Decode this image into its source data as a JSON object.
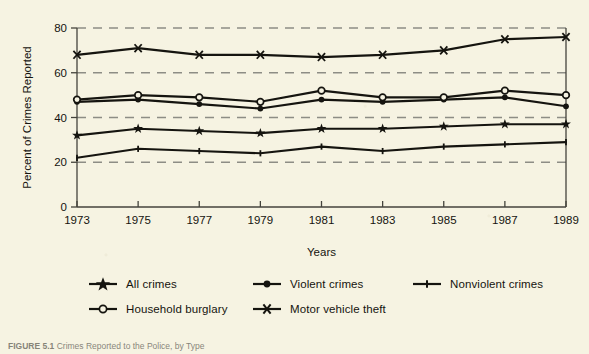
{
  "figure": {
    "caption_label": "FIGURE 5.1",
    "caption_body": "Crimes Reported to the Police, by Type"
  },
  "chart_data": {
    "type": "line",
    "title": "",
    "xlabel": "Years",
    "ylabel": "Percent of Crimes Reported",
    "x": [
      1973,
      1975,
      1977,
      1979,
      1981,
      1983,
      1985,
      1987,
      1989
    ],
    "xtick_labels": [
      "1973",
      "1975",
      "1977",
      "1979",
      "1981",
      "1983",
      "1985",
      "1987",
      "1989"
    ],
    "ytick_labels": [
      "0",
      "20",
      "40",
      "60",
      "80"
    ],
    "yticks": [
      0,
      20,
      40,
      60,
      80
    ],
    "ylim": [
      0,
      80
    ],
    "xlim": [
      1973,
      1989
    ],
    "grid": "horizontal-dashed",
    "legend_position": "below-plot",
    "series": [
      {
        "name": "All crimes",
        "marker": "star",
        "values": [
          32,
          35,
          34,
          33,
          35,
          35,
          36,
          37,
          37
        ]
      },
      {
        "name": "Violent crimes",
        "marker": "filled-circle",
        "values": [
          47,
          48,
          46,
          44,
          48,
          47,
          48,
          49,
          45
        ]
      },
      {
        "name": "Nonviolent crimes",
        "marker": "small-plus",
        "values": [
          22,
          26,
          25,
          24,
          27,
          25,
          27,
          28,
          29
        ]
      },
      {
        "name": "Household burglary",
        "marker": "open-circle",
        "values": [
          48,
          50,
          49,
          47,
          52,
          49,
          49,
          52,
          50
        ]
      },
      {
        "name": "Motor vehicle theft",
        "marker": "x-cross",
        "values": [
          68,
          71,
          68,
          68,
          67,
          68,
          70,
          75,
          76
        ]
      }
    ]
  },
  "colors": {
    "background": "#f6f3e2",
    "ink": "#15140f",
    "grid": "#8d8d85",
    "axis": "#44433c"
  }
}
